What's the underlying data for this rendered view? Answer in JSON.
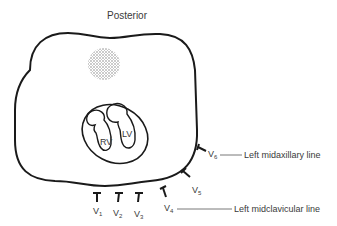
{
  "title": "Posterior",
  "chambers": {
    "rv": "RV",
    "lv": "LV"
  },
  "leads": [
    {
      "name": "V",
      "sub": "1"
    },
    {
      "name": "V",
      "sub": "2"
    },
    {
      "name": "V",
      "sub": "3"
    },
    {
      "name": "V",
      "sub": "4"
    },
    {
      "name": "V",
      "sub": "5"
    },
    {
      "name": "V",
      "sub": "6"
    }
  ],
  "annotations": {
    "midaxillary": "Left midaxillary line",
    "midclavicular": "Left midclavicular line"
  },
  "colors": {
    "stroke": "#1a1a1a",
    "text": "#3a3a3a",
    "spine": "#9a9a9a"
  }
}
